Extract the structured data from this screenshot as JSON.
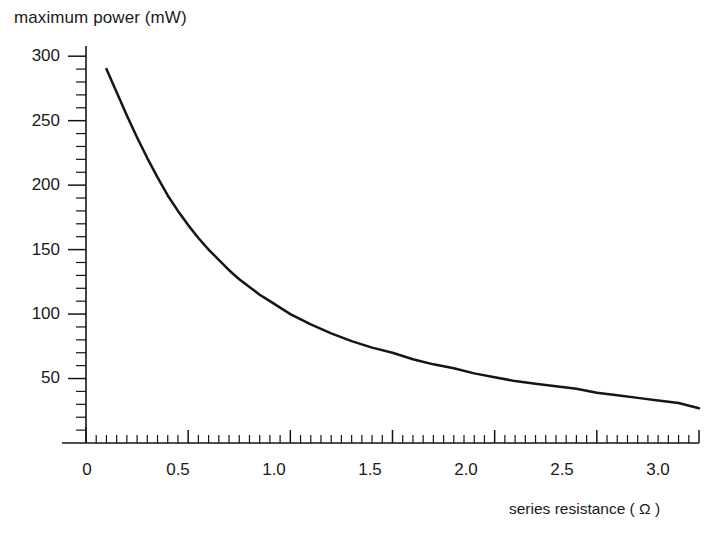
{
  "chart_data": {
    "type": "line",
    "title": "",
    "ylabel": "maximum power (mW)",
    "xlabel": "series resistance ( Ω )",
    "xlim": [
      0,
      3.0
    ],
    "ylim": [
      0,
      310
    ],
    "grid": false,
    "legend": null,
    "x_ticks": [
      "0",
      "0.5",
      "1.0",
      "1.5",
      "2.0",
      "2.5",
      "3.0"
    ],
    "x_tick_values": [
      0,
      0.5,
      1.0,
      1.5,
      2.0,
      2.5,
      3.0
    ],
    "x_minor_tick_step": 0.05,
    "y_ticks": [
      "50",
      "100",
      "150",
      "200",
      "250",
      "300"
    ],
    "y_tick_values": [
      50,
      100,
      150,
      200,
      250,
      300
    ],
    "y_minor_tick_step": 10,
    "series": [
      {
        "name": "maximum power",
        "x": [
          0.1,
          0.15,
          0.2,
          0.25,
          0.3,
          0.35,
          0.4,
          0.45,
          0.5,
          0.55,
          0.6,
          0.65,
          0.7,
          0.75,
          0.8,
          0.85,
          0.9,
          0.95,
          1.0,
          1.1,
          1.2,
          1.3,
          1.4,
          1.5,
          1.6,
          1.7,
          1.8,
          1.9,
          2.0,
          2.1,
          2.2,
          2.3,
          2.4,
          2.5,
          2.6,
          2.7,
          2.8,
          2.9,
          3.0
        ],
        "y": [
          290,
          272,
          254,
          237,
          221,
          206,
          192,
          180,
          169,
          159,
          150,
          142,
          134,
          127,
          121,
          115,
          110,
          105,
          100,
          92,
          85,
          79,
          74,
          70,
          65,
          61,
          58,
          54,
          51,
          48,
          46,
          44,
          42,
          39,
          37,
          35,
          33,
          31,
          27
        ]
      }
    ]
  },
  "figure": {
    "background_color": "#ffffff",
    "line_color": "#151515",
    "text_color": "#1a1a1a"
  }
}
